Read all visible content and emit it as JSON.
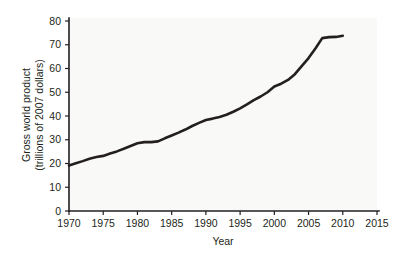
{
  "chart_data": {
    "type": "line",
    "title": "",
    "xlabel": "Year",
    "ylabel": "Gross world product\n(trillions of 2007 dollars)",
    "ylabel_line1": "Gross world product",
    "ylabel_line2": "(trillions of 2007 dollars)",
    "xlim": [
      1970,
      2015
    ],
    "ylim": [
      0,
      80
    ],
    "xticks": [
      1970,
      1975,
      1980,
      1985,
      1990,
      1995,
      2000,
      2005,
      2010,
      2015
    ],
    "yticks": [
      0,
      10,
      20,
      30,
      40,
      50,
      60,
      70,
      80
    ],
    "xtick_labels": [
      "1970",
      "1975",
      "1980",
      "1985",
      "1990",
      "1995",
      "2000",
      "2005",
      "2010",
      "2015"
    ],
    "ytick_labels": [
      "0",
      "10",
      "20",
      "30",
      "40",
      "50",
      "60",
      "70",
      "80"
    ],
    "grid": false,
    "legend": false,
    "line_color": "#231f20",
    "background_color": "#f9f9f8",
    "series": [
      {
        "name": "Gross world product",
        "x": [
          1970,
          1971,
          1972,
          1973,
          1974,
          1975,
          1976,
          1977,
          1978,
          1979,
          1980,
          1981,
          1982,
          1983,
          1984,
          1985,
          1986,
          1987,
          1988,
          1989,
          1990,
          1991,
          1992,
          1993,
          1994,
          1995,
          1996,
          1997,
          1998,
          1999,
          2000,
          2001,
          2002,
          2003,
          2004,
          2005,
          2006,
          2007,
          2008,
          2009,
          2010
        ],
        "y": [
          19.2,
          20.1,
          21.0,
          22.0,
          22.7,
          23.2,
          24.2,
          25.1,
          26.2,
          27.4,
          28.5,
          29.0,
          29.0,
          29.3,
          30.6,
          31.8,
          33.0,
          34.3,
          35.8,
          37.1,
          38.3,
          38.9,
          39.6,
          40.5,
          41.8,
          43.2,
          44.9,
          46.7,
          48.2,
          50.0,
          52.4,
          53.6,
          55.2,
          57.6,
          61.0,
          64.4,
          68.4,
          72.8,
          73.2,
          73.3,
          73.8
        ]
      }
    ]
  },
  "figure": {
    "name": "gross-world-product-line-chart"
  }
}
